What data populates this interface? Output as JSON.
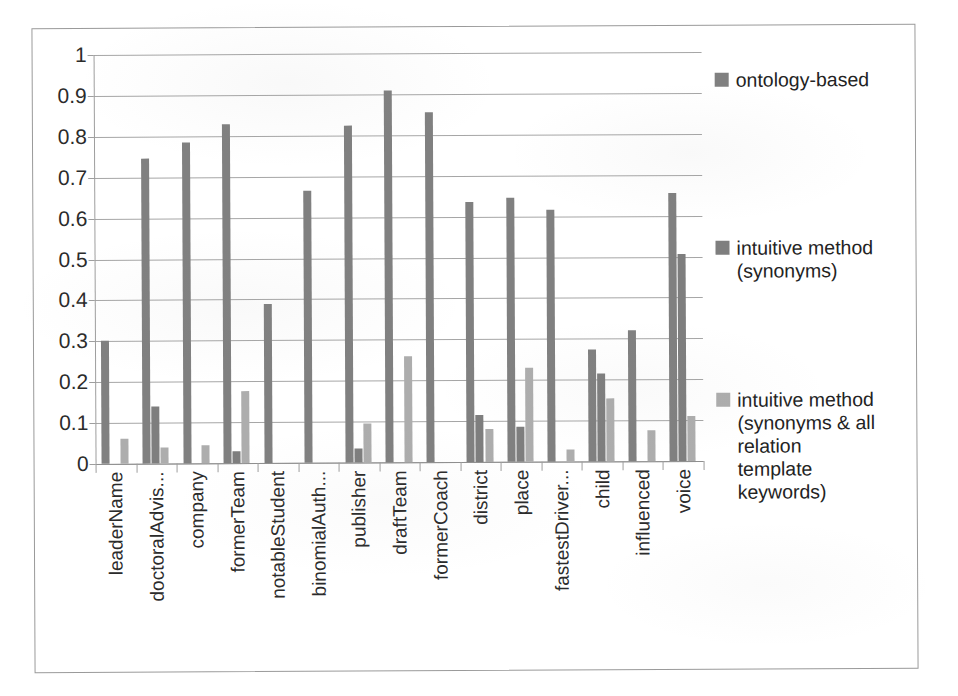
{
  "chart_data": {
    "type": "bar",
    "title": "",
    "xlabel": "",
    "ylabel": "",
    "ylim": [
      0,
      1
    ],
    "ytick_labels": [
      "1",
      "0.9",
      "0.8",
      "0.7",
      "0.6",
      "0.5",
      "0.4",
      "0.3",
      "0.2",
      "0.1",
      "0"
    ],
    "ytick_values": [
      1,
      0.9,
      0.8,
      0.7,
      0.6,
      0.5,
      0.4,
      0.3,
      0.2,
      0.1,
      0
    ],
    "grid": true,
    "legend_position": "right",
    "categories": [
      "leaderName",
      "doctoralAdvis...",
      "company",
      "formerTeam",
      "notableStudent",
      "binomialAuth...",
      "publisher",
      "draftTeam",
      "formerCoach",
      "district",
      "place",
      "fastestDriver...",
      "child",
      "influenced",
      "voice"
    ],
    "series": [
      {
        "name": "ontology-based",
        "color": "#808080",
        "values": [
          0.3,
          0.745,
          0.785,
          0.83,
          0.39,
          0.665,
          0.825,
          0.91,
          0.855,
          0.635,
          0.645,
          0.615,
          0.275,
          0.32,
          0.655
        ]
      },
      {
        "name": "intuitive method (synonyms)",
        "color": "#7e7e7e",
        "values": [
          0,
          0.14,
          0,
          0.03,
          0,
          0,
          0.035,
          0,
          0,
          0.115,
          0.085,
          0,
          0.215,
          0,
          0.505
        ]
      },
      {
        "name": "intuitive method (synonyms & all relation template keywords)",
        "color": "#adadad",
        "values": [
          0.06,
          0.04,
          0.045,
          0.175,
          0,
          0,
          0.095,
          0.26,
          0,
          0.08,
          0.23,
          0.03,
          0.155,
          0.075,
          0.11
        ]
      }
    ]
  },
  "legend": {
    "entries": [
      {
        "label": "ontology-based",
        "color": "#808080"
      },
      {
        "label": "intuitive method\n(synonyms)",
        "color": "#7e7e7e"
      },
      {
        "label": "intuitive method\n(synonyms & all\nrelation\ntemplate\nkeywords)",
        "color": "#adadad"
      }
    ]
  }
}
